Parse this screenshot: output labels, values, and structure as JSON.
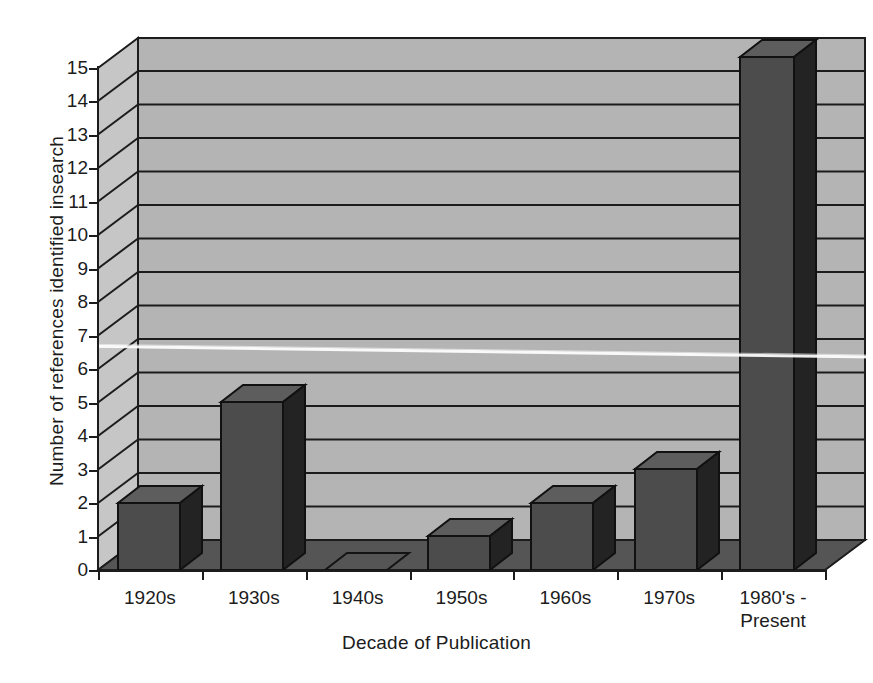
{
  "chart_data": {
    "type": "bar",
    "title": "",
    "xlabel": "Decade of Publication",
    "ylabel": "Number of references identified insearch",
    "categories": [
      "1920s",
      "1930s",
      "1940s",
      "1950s",
      "1960s",
      "1970s",
      "1980's - Present"
    ],
    "values": [
      2,
      5,
      0,
      1,
      2,
      3,
      15.3
    ],
    "ylim": [
      0,
      15
    ],
    "yticks": [
      0,
      1,
      2,
      3,
      4,
      5,
      6,
      7,
      8,
      9,
      10,
      11,
      12,
      13,
      14,
      15
    ],
    "ytick_labels": [
      "0",
      "1",
      "2",
      "3",
      "4",
      "5",
      "6",
      "7",
      "8",
      "9",
      "10",
      "11",
      "12",
      "13",
      "14",
      "15"
    ],
    "grid": true,
    "legend": false,
    "style": "3d-column",
    "colors": {
      "bar_front": "#4c4c4c",
      "bar_side": "#262626",
      "bar_top": "#5e5e5e",
      "wall_back": "#b4b4b4",
      "wall_left": "#c3c3c3",
      "floor": "#555555",
      "gridline": "#1c1c1c",
      "axis": "#1c1c1c",
      "background": "#ffffff"
    }
  },
  "labels": {
    "x_axis_title": "Decade of Publication",
    "y_axis_title": "Number of references identified insearch",
    "category_lines": [
      [
        "1920s"
      ],
      [
        "1930s"
      ],
      [
        "1940s"
      ],
      [
        "1950s"
      ],
      [
        "1960s"
      ],
      [
        "1970s"
      ],
      [
        "1980's -",
        "Present"
      ]
    ]
  }
}
